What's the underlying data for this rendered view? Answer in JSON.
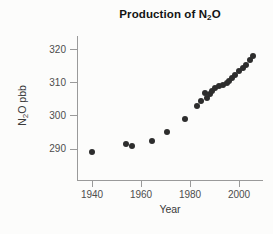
{
  "window": {
    "width": 273,
    "height": 234
  },
  "chart_data": {
    "type": "scatter",
    "title": {
      "text": "Production of N2O",
      "prefix": "Production of N",
      "sub": "2",
      "suffix": "O"
    },
    "xlabel": "Year",
    "ylabel": {
      "text": "N2O pbb",
      "prefix": "N",
      "sub": "2",
      "suffix": "O pbb"
    },
    "x_ticks": [
      1940,
      1960,
      1980,
      2000
    ],
    "y_ticks": [
      290,
      300,
      310,
      320
    ],
    "xlim": [
      1934,
      2009
    ],
    "ylim": [
      281,
      324
    ],
    "grid": false,
    "legend": false,
    "marker": {
      "shape": "circle",
      "diameter_px": 6,
      "color": "#2d2d2d"
    },
    "colors": {
      "background": "#fcfcfb",
      "axis": "#9a9a9a",
      "tick_text": "#4d4d4d",
      "title_text": "#141414",
      "point": "#2d2d2d"
    },
    "points": [
      {
        "x": 1940,
        "y": 289
      },
      {
        "x": 1954,
        "y": 291.5
      },
      {
        "x": 1956.5,
        "y": 291
      },
      {
        "x": 1964.5,
        "y": 292.5
      },
      {
        "x": 1970.5,
        "y": 295
      },
      {
        "x": 1978,
        "y": 299
      },
      {
        "x": 1983,
        "y": 303
      },
      {
        "x": 1984.5,
        "y": 304.5
      },
      {
        "x": 1986,
        "y": 307
      },
      {
        "x": 1987,
        "y": 305.5
      },
      {
        "x": 1988,
        "y": 306.5
      },
      {
        "x": 1989,
        "y": 307.5
      },
      {
        "x": 1990,
        "y": 308.5
      },
      {
        "x": 1992,
        "y": 309
      },
      {
        "x": 1993.5,
        "y": 309.5
      },
      {
        "x": 1995,
        "y": 310
      },
      {
        "x": 1996,
        "y": 310.5
      },
      {
        "x": 1997,
        "y": 311.5
      },
      {
        "x": 1998.5,
        "y": 312.5
      },
      {
        "x": 2000,
        "y": 313.5
      },
      {
        "x": 2001.5,
        "y": 314.5
      },
      {
        "x": 2003,
        "y": 315.5
      },
      {
        "x": 2004.5,
        "y": 317
      },
      {
        "x": 2005.5,
        "y": 318
      }
    ]
  }
}
